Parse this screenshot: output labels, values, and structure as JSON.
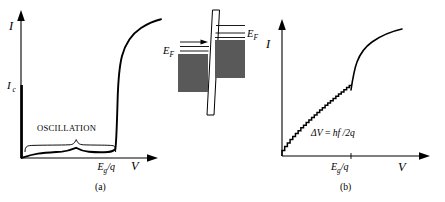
{
  "figure": {
    "caption_a": "(a)",
    "caption_b": "(b)",
    "background_color": "#ffffff",
    "line_color": "#000000",
    "band_fill_color": "#595959"
  },
  "panel_a": {
    "name": "dc Josephson / tunneling I-V characteristic",
    "y_axis_label": "I",
    "x_axis_label": "V",
    "critical_current_label": "I",
    "critical_current_sub": "c",
    "oscillation_label": "OSCILLATION",
    "gap_voltage_label": "E",
    "gap_voltage_sub": "g",
    "gap_voltage_tail": "/q"
  },
  "panel_b": {
    "name": "Shapiro step staircase I-V characteristic",
    "y_axis_label": "I",
    "x_axis_label": "V",
    "step_formula_delta": "ΔV",
    "step_formula_equals": " = ",
    "step_formula_rhs": "hf",
    "step_formula_tail": " /2q",
    "gap_voltage_label": "E",
    "gap_voltage_sub": "g",
    "gap_voltage_tail": "/q",
    "step_count": 26
  },
  "inset": {
    "name": "superconductor tunnel junction band diagram",
    "fermi_level_left": "E",
    "fermi_level_left_sub": "F",
    "fermi_level_right": "E",
    "fermi_level_right_sub": "F"
  },
  "chart_data": [
    {
      "type": "line",
      "title": "(a)",
      "xlabel": "V",
      "ylabel": "I",
      "annotations": [
        "OSCILLATION",
        "Eg/q",
        "Ic"
      ],
      "description": "Supercurrent spike at V=0 rising to Ic, near-zero quasiparticle current with small oscillation bump, sharp rise at the gap voltage Eg/q saturating at high current",
      "series": [
        {
          "name": "supercurrent-branch",
          "x": [
            0,
            0
          ],
          "y": [
            0,
            0.52
          ]
        },
        {
          "name": "quasiparticle-branch",
          "x": [
            0.0,
            0.06,
            0.14,
            0.24,
            0.34,
            0.44,
            0.5,
            0.56,
            0.62,
            0.7,
            0.78,
            0.84,
            0.88,
            0.9,
            0.91,
            0.92,
            0.94,
            0.98,
            1.05,
            1.15,
            1.28,
            1.45,
            1.65,
            1.85
          ],
          "y": [
            0.0,
            0.018,
            0.03,
            0.036,
            0.04,
            0.046,
            0.058,
            0.046,
            0.04,
            0.038,
            0.038,
            0.04,
            0.046,
            0.09,
            0.3,
            0.55,
            0.72,
            0.8,
            0.86,
            0.905,
            0.94,
            0.965,
            0.985,
            1.0
          ]
        }
      ],
      "xlim": [
        0,
        2.0
      ],
      "ylim": [
        0,
        1.08
      ],
      "grid": false,
      "legend": false
    },
    {
      "type": "line",
      "title": "(b)",
      "xlabel": "V",
      "ylabel": "I",
      "annotations": [
        "ΔV = hf /2q",
        "Eg/q"
      ],
      "description": "Microwave-irradiated junction: constant-voltage Shapiro steps forming a staircase up to the gap voltage Eg/q, then a steep rise and saturation",
      "series": [
        {
          "name": "shapiro-staircase",
          "step_count": 26,
          "x_start": 0.0,
          "x_end": 1.0,
          "y_start": 0.0,
          "y_end": 0.6
        },
        {
          "name": "above-gap-branch",
          "x": [
            1.0,
            1.03,
            1.08,
            1.16,
            1.26,
            1.4,
            1.55,
            1.72,
            1.88
          ],
          "y": [
            0.6,
            0.7,
            0.79,
            0.86,
            0.905,
            0.945,
            0.975,
            0.995,
            1.0
          ]
        }
      ],
      "xlim": [
        0,
        2.0
      ],
      "ylim": [
        0,
        1.08
      ],
      "grid": false,
      "legend": false
    }
  ]
}
